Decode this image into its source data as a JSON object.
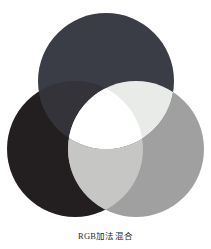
{
  "figure": {
    "caption": "RGB加法混合",
    "background_color": "#ffffff",
    "rendering": "grayscale"
  },
  "chart_data": {
    "type": "venn",
    "title": "RGB加法混合",
    "subtitle": "",
    "xlabel": "",
    "ylabel": "",
    "legend_position": "none",
    "grid": false,
    "set_count": 3,
    "canvas": {
      "width": 211,
      "height": 249,
      "diagram_height": 226
    },
    "sets": [
      {
        "name": "Blue",
        "label": "B",
        "position": "top",
        "cx": 106,
        "cy": 81,
        "r": 68,
        "color": "#3a3d46",
        "true_color": "#0000ff"
      },
      {
        "name": "Red",
        "label": "R",
        "position": "bottom-left",
        "cx": 75,
        "cy": 149,
        "r": 68,
        "color": "#231f20",
        "true_color": "#ff0000"
      },
      {
        "name": "Green",
        "label": "G",
        "position": "bottom-right",
        "cx": 136,
        "cy": 149,
        "r": 68,
        "color": "#a0a0a0",
        "true_color": "#00ff00"
      }
    ],
    "intersections": [
      {
        "name": "Magenta",
        "sets": [
          "Blue",
          "Red"
        ],
        "color": "#35333a",
        "true_color": "#ff00ff"
      },
      {
        "name": "Cyan",
        "sets": [
          "Blue",
          "Green"
        ],
        "color": "#e9ebe8",
        "true_color": "#00ffff"
      },
      {
        "name": "Yellow",
        "sets": [
          "Red",
          "Green"
        ],
        "color": "#c6c7c4",
        "true_color": "#ffff00"
      },
      {
        "name": "White",
        "sets": [
          "Blue",
          "Red",
          "Green"
        ],
        "color": "#ffffff",
        "true_color": "#ffffff"
      }
    ]
  }
}
